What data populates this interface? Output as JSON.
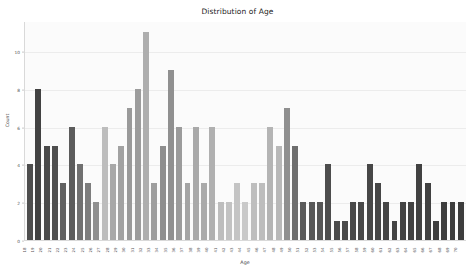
{
  "chart_data": {
    "type": "bar",
    "title": "Distribution of Age",
    "xlabel": "Age",
    "ylabel": "Count",
    "ylim": [
      0,
      11.6
    ],
    "yticks": [
      0,
      2,
      4,
      6,
      8,
      10
    ],
    "grid": true,
    "legend": null,
    "categories": [
      "18",
      "19",
      "20",
      "21",
      "22",
      "23",
      "24",
      "25",
      "26",
      "27",
      "28",
      "29",
      "30",
      "31",
      "32",
      "33",
      "34",
      "35",
      "36",
      "37",
      "38",
      "39",
      "40",
      "41",
      "42",
      "43",
      "44",
      "45",
      "46",
      "47",
      "48",
      "49",
      "50",
      "51",
      "52",
      "53",
      "54",
      "55",
      "56",
      "57",
      "58",
      "59",
      "60",
      "61",
      "62",
      "63",
      "64",
      "65",
      "66",
      "67",
      "68",
      "69",
      "70"
    ],
    "values": [
      4,
      8,
      5,
      5,
      3,
      6,
      4,
      3,
      2,
      6,
      4,
      5,
      7,
      8,
      11,
      3,
      5,
      9,
      6,
      3,
      6,
      3,
      6,
      2,
      2,
      3,
      2,
      3,
      3,
      6,
      5,
      7,
      5,
      2,
      2,
      2,
      4,
      1,
      1,
      2,
      2,
      4,
      3,
      2,
      1,
      2,
      2,
      4,
      3,
      1,
      2,
      2,
      2
    ],
    "bar_colors": [
      "#4e4e4e",
      "#424242",
      "#4a4a4a",
      "#4f4f4f",
      "#606060",
      "#5c5c5c",
      "#707070",
      "#7d7d7d",
      "#8f8f8f",
      "#bdbdbd",
      "#a8a8a8",
      "#a2a2a2",
      "#9a9a9a",
      "#9c9c9c",
      "#aeaeae",
      "#9e9e9e",
      "#8e8e8e",
      "#909090",
      "#9b9b9b",
      "#a4a4a4",
      "#a9a9a9",
      "#aaaaaa",
      "#b0b0b0",
      "#bdbdbd",
      "#c2c2c2",
      "#c4c4c4",
      "#c9c9c9",
      "#bebebe",
      "#bdbdbd",
      "#b4b4b4",
      "#b8b8b8",
      "#8f8f8f",
      "#6e6e6e",
      "#5a5a5a",
      "#585858",
      "#565656",
      "#4d4d4d",
      "#4b4b4b",
      "#4a4a4a",
      "#494949",
      "#484848",
      "#474747",
      "#464646",
      "#454545",
      "#444444",
      "#434343",
      "#424242",
      "#414141",
      "#404040",
      "#3f3f3f",
      "#3e3e3e",
      "#3d3d3d",
      "#3c3c3c"
    ]
  },
  "figure": {
    "background_color": "#ffffff",
    "plot_background_color": "#fbfbfb",
    "grid_color": "#ececec",
    "axis_color": "#d9d9d9",
    "text_color": "#2b2b2b"
  }
}
